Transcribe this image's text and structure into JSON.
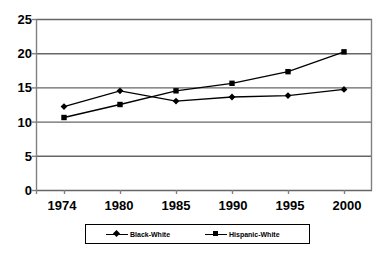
{
  "chart_data": {
    "type": "line",
    "title": "",
    "subtitle": "",
    "xlabel": "",
    "ylabel": "",
    "categories": [
      "1974",
      "1980",
      "1985",
      "1990",
      "1995",
      "2000"
    ],
    "series": [
      {
        "name": "Black-White",
        "marker": "diamond",
        "color": "#000000",
        "values": [
          12.2,
          14.5,
          13.0,
          13.6,
          13.8,
          14.7
        ]
      },
      {
        "name": "Hispanic-White",
        "marker": "square",
        "color": "#000000",
        "values": [
          10.6,
          12.5,
          14.5,
          15.6,
          17.3,
          20.2
        ]
      }
    ],
    "ylim": [
      0,
      25
    ],
    "yticks": [
      0,
      5,
      10,
      15,
      20,
      25
    ],
    "ytick_labels": [
      "0",
      "5",
      "10",
      "15",
      "20",
      "25"
    ],
    "grid": "horizontal",
    "legend_position": "bottom",
    "plot_border": true,
    "colors": {
      "line": "#000000",
      "gridline": "#666666",
      "axis": "#808080",
      "background": "#ffffff"
    }
  },
  "legend": {
    "entries": [
      {
        "label": "Black-White",
        "marker": "diamond"
      },
      {
        "label": "Hispanic-White",
        "marker": "square"
      }
    ]
  }
}
